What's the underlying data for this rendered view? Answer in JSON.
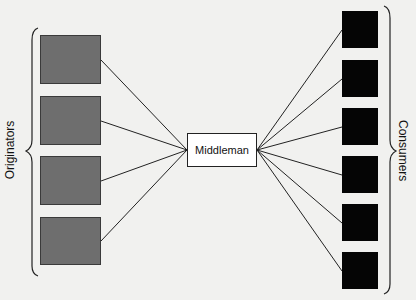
{
  "diagram": {
    "left_group": {
      "label": "Originators",
      "count": 4,
      "color": "#6e6e6e"
    },
    "center": {
      "label": "Middleman"
    },
    "right_group": {
      "label": "Consumers",
      "count": 6,
      "color": "#050505"
    }
  }
}
